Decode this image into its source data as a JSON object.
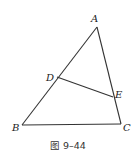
{
  "figure": {
    "caption": "图 9–44",
    "points": {
      "A": {
        "label": "A",
        "x": 97,
        "y": 27
      },
      "B": {
        "label": "B",
        "x": 22,
        "y": 125
      },
      "C": {
        "label": "C",
        "x": 121,
        "y": 124
      },
      "D": {
        "label": "D",
        "x": 57,
        "y": 77
      },
      "E": {
        "label": "E",
        "x": 113,
        "y": 97
      }
    },
    "segments": [
      [
        "A",
        "B"
      ],
      [
        "A",
        "C"
      ],
      [
        "B",
        "C"
      ],
      [
        "D",
        "E"
      ]
    ],
    "stroke_color": "#333333"
  }
}
